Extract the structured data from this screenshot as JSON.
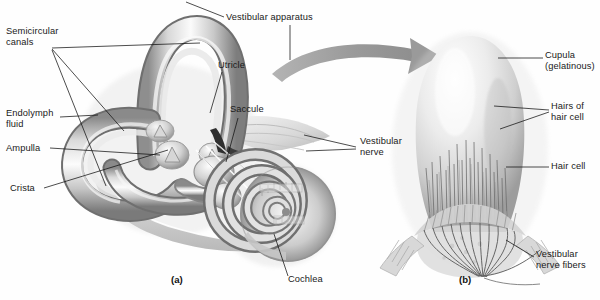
{
  "figure": {
    "kind": "anatomical-illustration",
    "style": "grayscale airbrush medical illustration",
    "background_color": "#ffffff",
    "ink_color": "#111111",
    "arrow_color": "#9b9b9b"
  },
  "panels": [
    {
      "id": "a",
      "caption": "(a)",
      "x": 178,
      "y": 281
    },
    {
      "id": "b",
      "caption": "(b)",
      "x": 466,
      "y": 281
    }
  ],
  "labels": [
    {
      "name": "semicircular-canals",
      "text": "Semicircular\ncanals",
      "x": 6,
      "y": 26,
      "align": "left",
      "panel": "a"
    },
    {
      "name": "endolymph-fluid",
      "text": "Endolymph\nfluid",
      "x": 6,
      "y": 114,
      "align": "left",
      "panel": "a"
    },
    {
      "name": "ampulla",
      "text": "Ampulla",
      "x": 6,
      "y": 145,
      "align": "left",
      "panel": "a"
    },
    {
      "name": "crista",
      "text": "Crista",
      "x": 10,
      "y": 184,
      "align": "left",
      "panel": "a"
    },
    {
      "name": "vestibular-apparatus",
      "text": "Vestibular apparatus",
      "x": 226,
      "y": 14,
      "align": "left",
      "panel": "a"
    },
    {
      "name": "utricle",
      "text": "Utricle",
      "x": 218,
      "y": 62,
      "align": "left",
      "panel": "a"
    },
    {
      "name": "saccule",
      "text": "Saccule",
      "x": 230,
      "y": 106,
      "align": "left",
      "panel": "a"
    },
    {
      "name": "vestibular-nerve",
      "text": "Vestibular\nnerve",
      "x": 360,
      "y": 139,
      "align": "left",
      "panel": "a"
    },
    {
      "name": "cochlea",
      "text": "Cochlea",
      "x": 288,
      "y": 276,
      "align": "left",
      "panel": "a"
    },
    {
      "name": "cupula-gelatinous",
      "text": "Cupula\n(gelatinous)",
      "x": 545,
      "y": 53,
      "align": "left",
      "panel": "b"
    },
    {
      "name": "hairs-of-hair-cell",
      "text": "Hairs of\nhair cell",
      "x": 551,
      "y": 103,
      "align": "left",
      "panel": "b"
    },
    {
      "name": "hair-cell",
      "text": "Hair cell",
      "x": 551,
      "y": 163,
      "align": "left",
      "panel": "b"
    },
    {
      "name": "vestibular-nerve-fibers",
      "text": "Vestibular\nnerve fibers",
      "x": 536,
      "y": 252,
      "align": "left",
      "panel": "b"
    }
  ],
  "structures_a": [
    "anterior semicircular canal loop",
    "lateral semicircular canal loop",
    "posterior semicircular canal loop",
    "ampullae with crista",
    "utricle",
    "saccule",
    "vestibular nerve branches",
    "cochlear spiral"
  ],
  "structures_b": [
    "cupula dome",
    "stereocilia hair bundles",
    "row of hair cells",
    "converging vestibular nerve fibers"
  ],
  "arrow": {
    "name": "magnification-arrow",
    "description": "curved gray arrow pointing from vestibular apparatus to the cupula close-up",
    "from_x": 272,
    "from_y": 72,
    "to_x": 434,
    "to_y": 56
  }
}
